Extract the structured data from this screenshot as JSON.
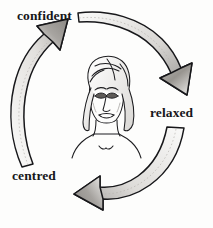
{
  "diagram": {
    "background_color": "#fdfdfc",
    "ink_color": "#17171a",
    "arrow_fill_light": "#f2f1ef",
    "arrow_fill_shade": "#8d8b88",
    "labels": {
      "confident": "confident",
      "relaxed": "relaxed",
      "centred": "centred"
    },
    "arrows": [
      {
        "name": "arrow-confident-to-relaxed",
        "from": "confident",
        "to": "relaxed",
        "direction": "clockwise-top-right",
        "head_points": "down-right"
      },
      {
        "name": "arrow-relaxed-to-centred",
        "from": "relaxed",
        "to": "centred",
        "direction": "clockwise-bottom",
        "head_points": "left"
      },
      {
        "name": "arrow-centred-to-confident",
        "from": "centred",
        "to": "confident",
        "direction": "clockwise-left",
        "head_points": "up-right"
      }
    ],
    "center_illustration": {
      "name": "womans-face-illustration",
      "description": "line drawing of a woman's face with bobbed hair, closed eyes, neck and shoulders"
    }
  }
}
